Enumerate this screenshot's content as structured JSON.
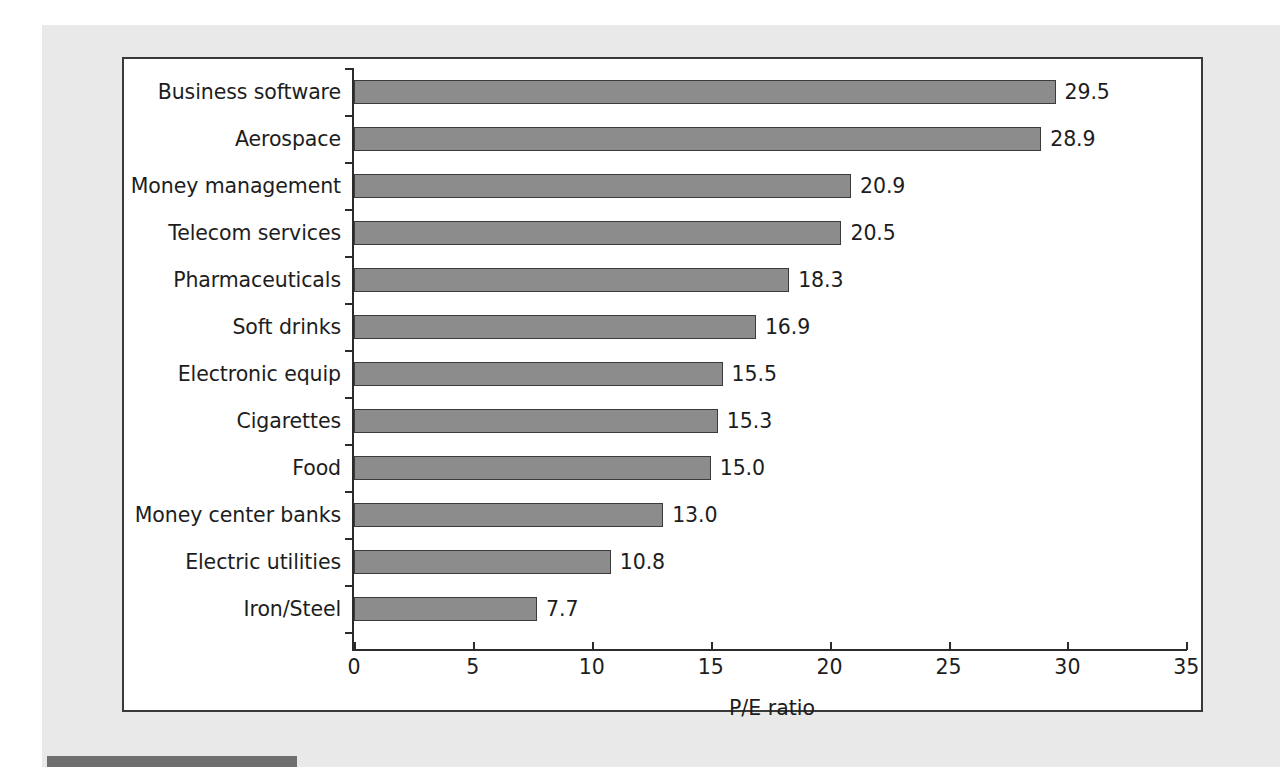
{
  "figure": {
    "background_color": "#e9e9e9",
    "plot_background_color": "#ffffff",
    "frame_color": "#3a3a3a",
    "footer_rule_color": "#6f6f6f"
  },
  "chart_data": {
    "type": "bar",
    "orientation": "horizontal",
    "title": "",
    "subtitle": "",
    "xlabel": "P/E ratio",
    "ylabel": "",
    "xlim": [
      0,
      35
    ],
    "ylim": null,
    "grid": false,
    "legend": null,
    "bar_color": "#8c8c8c",
    "bar_edge_color": "#3b3b3b",
    "xticks": [
      0,
      5,
      10,
      15,
      20,
      25,
      30,
      35
    ],
    "xtick_labels": [
      "0",
      "5",
      "10",
      "15",
      "20",
      "25",
      "30",
      "35"
    ],
    "categories": [
      "Business software",
      "Aerospace",
      "Money management",
      "Telecom services",
      "Pharmaceuticals",
      "Soft drinks",
      "Electronic equip",
      "Cigarettes",
      "Food",
      "Money center banks",
      "Electric utilities",
      "Iron/Steel"
    ],
    "values": [
      29.5,
      28.9,
      20.9,
      20.5,
      18.3,
      16.9,
      15.5,
      15.3,
      15.0,
      13.0,
      10.8,
      7.7
    ],
    "value_labels": [
      "29.5",
      "28.9",
      "20.9",
      "20.5",
      "18.3",
      "16.9",
      "15.5",
      "15.3",
      "15.0",
      "13.0",
      "10.8",
      "7.7"
    ],
    "annotations": []
  }
}
